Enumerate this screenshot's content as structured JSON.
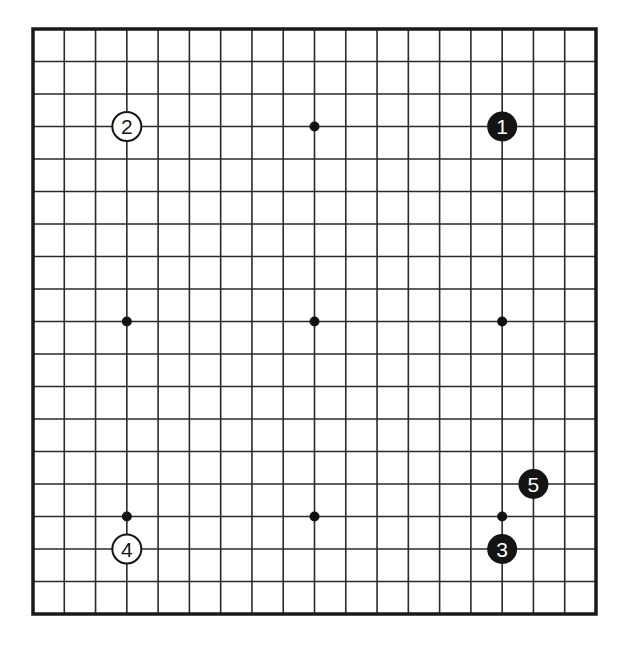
{
  "board": {
    "size": 19,
    "left": 33,
    "top": 29,
    "right": 596,
    "bottom": 614,
    "line_color": "#2a2a2a",
    "border_color": "#1a1a1a",
    "background": "#ffffff",
    "star_points": [
      [
        3,
        3
      ],
      [
        9,
        3
      ],
      [
        15,
        3
      ],
      [
        3,
        9
      ],
      [
        9,
        9
      ],
      [
        15,
        9
      ],
      [
        3,
        15
      ],
      [
        9,
        15
      ],
      [
        15,
        15
      ]
    ]
  },
  "stones": [
    {
      "label": "1",
      "color": "black",
      "col": 15,
      "row": 3
    },
    {
      "label": "2",
      "color": "white",
      "col": 3,
      "row": 3
    },
    {
      "label": "3",
      "color": "black",
      "col": 15,
      "row": 16
    },
    {
      "label": "4",
      "color": "white",
      "col": 3,
      "row": 16
    },
    {
      "label": "5",
      "color": "black",
      "col": 16,
      "row": 14
    }
  ]
}
